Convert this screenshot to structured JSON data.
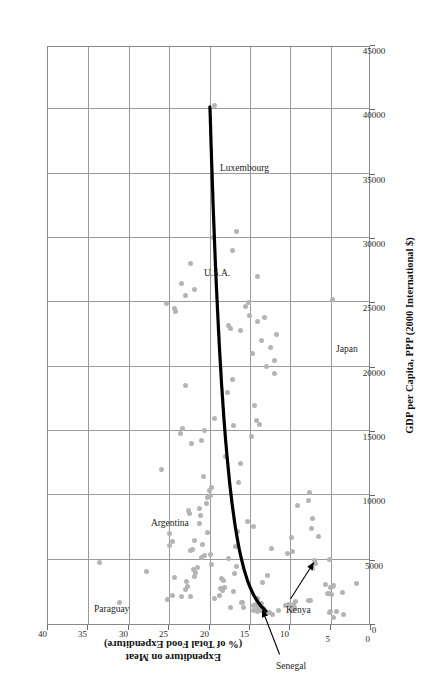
{
  "chart_data": {
    "type": "scatter",
    "title": "",
    "xlabel": "GDP per Capita, PPP (2000 International $)",
    "ylabel_line1": "Expenditure on Meat",
    "ylabel_line2": "(% of Total Food Expenditure)",
    "xlim": [
      0,
      45000
    ],
    "ylim": [
      0,
      40
    ],
    "xticks": [
      0,
      5000,
      10000,
      15000,
      20000,
      25000,
      30000,
      35000,
      40000,
      45000
    ],
    "xtick_labels": [
      "0",
      "5000",
      "10000",
      "15000",
      "20000",
      "25000",
      "30000",
      "35000",
      "40000",
      "45000"
    ],
    "yticks": [
      0,
      5,
      10,
      15,
      20,
      25,
      30,
      35,
      40
    ],
    "ytick_labels": [
      "0",
      "5",
      "10",
      "15",
      "20",
      "25",
      "30",
      "35",
      "40"
    ],
    "grid": true,
    "legend": "none",
    "point_color": "#b4b4b4",
    "curve_color": "#000000",
    "grid_color": "#9a9a9a",
    "points": [
      [
        520,
        4.6
      ],
      [
        700,
        3.4
      ],
      [
        760,
        12.2
      ],
      [
        800,
        13.0
      ],
      [
        880,
        12.6
      ],
      [
        900,
        5.1
      ],
      [
        950,
        5.0
      ],
      [
        980,
        4.3
      ],
      [
        1000,
        14.1
      ],
      [
        1020,
        13.6
      ],
      [
        1060,
        14.6
      ],
      [
        1080,
        11.5
      ],
      [
        1100,
        9.8
      ],
      [
        1150,
        14.2
      ],
      [
        1180,
        13.8
      ],
      [
        1200,
        13.3
      ],
      [
        1250,
        17.4
      ],
      [
        1280,
        15.8
      ],
      [
        1300,
        9.5
      ],
      [
        1320,
        9.9
      ],
      [
        1400,
        10.6
      ],
      [
        1420,
        14.5
      ],
      [
        1450,
        13.9
      ],
      [
        1480,
        14.3
      ],
      [
        1500,
        9.6
      ],
      [
        1550,
        10.2
      ],
      [
        1600,
        13.5
      ],
      [
        1650,
        16.0
      ],
      [
        1680,
        15.9
      ],
      [
        1700,
        31.2
      ],
      [
        1750,
        9.3
      ],
      [
        1800,
        7.5
      ],
      [
        1850,
        7.8
      ],
      [
        1900,
        25.2
      ],
      [
        1950,
        19.4
      ],
      [
        2000,
        14.0
      ],
      [
        2100,
        23.5
      ],
      [
        2150,
        22.4
      ],
      [
        2200,
        18.8
      ],
      [
        2250,
        24.6
      ],
      [
        2300,
        4.9
      ],
      [
        2350,
        5.4
      ],
      [
        2400,
        5.1
      ],
      [
        2450,
        3.5
      ],
      [
        2500,
        17.0
      ],
      [
        2600,
        18.4
      ],
      [
        2700,
        23.0
      ],
      [
        2750,
        18.6
      ],
      [
        2800,
        18.2
      ],
      [
        2850,
        5.0
      ],
      [
        2900,
        22.7
      ],
      [
        2950,
        4.8
      ],
      [
        3000,
        4.7
      ],
      [
        3100,
        5.6
      ],
      [
        3150,
        1.8
      ],
      [
        3200,
        13.4
      ],
      [
        3300,
        22.9
      ],
      [
        3400,
        18.3
      ],
      [
        3500,
        18.5
      ],
      [
        3600,
        24.3
      ],
      [
        3700,
        21.8
      ],
      [
        3800,
        12.8
      ],
      [
        3900,
        16.9
      ],
      [
        4000,
        21.7
      ],
      [
        4100,
        27.8
      ],
      [
        4200,
        22.0
      ],
      [
        4300,
        7.3
      ],
      [
        4400,
        21.5
      ],
      [
        4500,
        16.6
      ],
      [
        4600,
        19.8
      ],
      [
        4700,
        6.9
      ],
      [
        4800,
        33.6
      ],
      [
        4900,
        7.0
      ],
      [
        5000,
        5.2
      ],
      [
        5100,
        17.6
      ],
      [
        5200,
        21.0
      ],
      [
        5300,
        20.6
      ],
      [
        5400,
        19.9
      ],
      [
        5500,
        10.4
      ],
      [
        5600,
        9.7
      ],
      [
        5700,
        22.3
      ],
      [
        5800,
        22.1
      ],
      [
        5900,
        12.3
      ],
      [
        6000,
        16.8
      ],
      [
        6100,
        25.0
      ],
      [
        6200,
        20.9
      ],
      [
        6400,
        24.6
      ],
      [
        6500,
        21.9
      ],
      [
        6700,
        9.8
      ],
      [
        6800,
        6.5
      ],
      [
        7000,
        24.9
      ],
      [
        7100,
        20.2
      ],
      [
        7200,
        16.5
      ],
      [
        7400,
        7.4
      ],
      [
        7600,
        14.6
      ],
      [
        7800,
        21.2
      ],
      [
        8000,
        15.3
      ],
      [
        8200,
        7.2
      ],
      [
        8400,
        21.1
      ],
      [
        8600,
        22.5
      ],
      [
        8800,
        22.6
      ],
      [
        9000,
        21.3
      ],
      [
        9200,
        9.1
      ],
      [
        9400,
        20.4
      ],
      [
        9600,
        7.7
      ],
      [
        9800,
        20.3
      ],
      [
        10000,
        19.9
      ],
      [
        10200,
        7.6
      ],
      [
        10400,
        20.0
      ],
      [
        10600,
        19.8
      ],
      [
        11000,
        16.4
      ],
      [
        11500,
        20.8
      ],
      [
        12000,
        26.0
      ],
      [
        12500,
        16.2
      ],
      [
        13000,
        18.0
      ],
      [
        14000,
        22.2
      ],
      [
        14300,
        21.0
      ],
      [
        14600,
        14.8
      ],
      [
        14800,
        23.6
      ],
      [
        15000,
        20.6
      ],
      [
        15200,
        23.4
      ],
      [
        15400,
        17.0
      ],
      [
        15500,
        13.8
      ],
      [
        15800,
        14.2
      ],
      [
        16000,
        19.4
      ],
      [
        17000,
        14.4
      ],
      [
        18000,
        17.8
      ],
      [
        18500,
        23.0
      ],
      [
        19000,
        17.1
      ],
      [
        19500,
        11.9
      ],
      [
        20000,
        13.0
      ],
      [
        20500,
        12.0
      ],
      [
        21000,
        14.7
      ],
      [
        21500,
        12.4
      ],
      [
        22000,
        13.6
      ],
      [
        22500,
        11.7
      ],
      [
        22800,
        16.2
      ],
      [
        23000,
        17.4
      ],
      [
        23200,
        17.6
      ],
      [
        23500,
        14.1
      ],
      [
        23800,
        13.2
      ],
      [
        24000,
        15.0
      ],
      [
        24300,
        24.2
      ],
      [
        24500,
        24.3
      ],
      [
        24700,
        15.5
      ],
      [
        24900,
        25.3
      ],
      [
        25000,
        15.2
      ],
      [
        25200,
        4.8
      ],
      [
        25500,
        23.0
      ],
      [
        26000,
        21.9
      ],
      [
        26500,
        23.5
      ],
      [
        27000,
        14.0
      ],
      [
        28000,
        22.4
      ],
      [
        29000,
        17.1
      ],
      [
        30000,
        19.5
      ],
      [
        30500,
        16.6
      ],
      [
        40300,
        19.4
      ]
    ],
    "trend_curve_note": "Fitted decreasing curve from ~(40000, 20) down to ~(1000, 13)",
    "annotations": [
      {
        "label": "Paraguay",
        "x": 4800,
        "y": 33.6
      },
      {
        "label": "Argentina",
        "x": 12000,
        "y": 26.0
      },
      {
        "label": "U.S.A.",
        "x": 30000,
        "y": 19.5
      },
      {
        "label": "Luxembourg",
        "x": 40300,
        "y": 19.4
      },
      {
        "label": "Japan",
        "x": 25200,
        "y": 4.8
      },
      {
        "label": "Senegal",
        "x": 1200,
        "y": 13.3
      },
      {
        "label": "Kenya",
        "x": 4900,
        "y": 7.0
      }
    ]
  }
}
